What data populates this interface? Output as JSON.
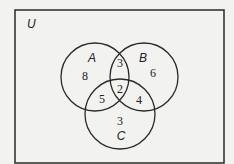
{
  "diagram": {
    "type": "venn-3-set",
    "universe_label": "U",
    "colors": {
      "background": "#f2f2f0",
      "stroke": "#2a2a2a",
      "text": "#222222"
    },
    "frame": {
      "x": 15,
      "y": 10,
      "width": 209,
      "height": 153
    },
    "sets": [
      {
        "id": "A",
        "label": "A",
        "cx": 95,
        "cy": 77,
        "r": 34
      },
      {
        "id": "B",
        "label": "B",
        "cx": 144,
        "cy": 77,
        "r": 34
      },
      {
        "id": "C",
        "label": "C",
        "cx": 120,
        "cy": 114,
        "r": 35
      }
    ],
    "regions": {
      "A_only": {
        "value": "8",
        "x": 85,
        "y": 80
      },
      "B_only": {
        "value": "6",
        "x": 153,
        "y": 77
      },
      "C_only": {
        "value": "3",
        "x": 120,
        "y": 125
      },
      "A_and_B_only": {
        "value": "3",
        "x": 120,
        "y": 67
      },
      "A_and_C_only": {
        "value": "5",
        "x": 102,
        "y": 103
      },
      "B_and_C_only": {
        "value": "4",
        "x": 139,
        "y": 104
      },
      "A_and_B_and_C": {
        "value": "2",
        "x": 120,
        "y": 93
      }
    },
    "label_positions": {
      "U": {
        "x": 27,
        "y": 28
      },
      "A": {
        "x": 92,
        "y": 62
      },
      "B": {
        "x": 143,
        "y": 62
      },
      "C": {
        "x": 121,
        "y": 140
      }
    }
  }
}
